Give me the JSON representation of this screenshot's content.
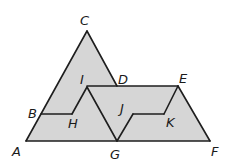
{
  "diagram": {
    "title": "",
    "fill_color": "#d6d6d6",
    "line_color": "#1e1e1e",
    "points": {
      "A": "A",
      "B": "B",
      "C": "C",
      "D": "D",
      "E": "E",
      "F": "F",
      "G": "G",
      "H": "H",
      "I": "I",
      "J": "J",
      "K": "K"
    },
    "segments": [
      [
        "A",
        "C"
      ],
      [
        "C",
        "D"
      ],
      [
        "A",
        "F"
      ],
      [
        "B",
        "H"
      ],
      [
        "H",
        "I"
      ],
      [
        "I",
        "G"
      ],
      [
        "I",
        "E"
      ],
      [
        "E",
        "F"
      ],
      [
        "G",
        "J"
      ],
      [
        "J",
        "K"
      ],
      [
        "K",
        "E"
      ]
    ]
  }
}
